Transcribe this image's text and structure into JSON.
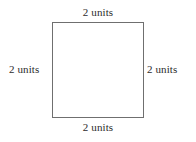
{
  "figure": {
    "shape": "square",
    "background_color": "#ffffff",
    "stroke_color": "#6f6f6f",
    "fill_color": "#ffffff",
    "text_color": "#2b2b2b",
    "labels": {
      "top": "2 units",
      "right": "2 units",
      "bottom": "2 units",
      "left": "2 units"
    }
  }
}
